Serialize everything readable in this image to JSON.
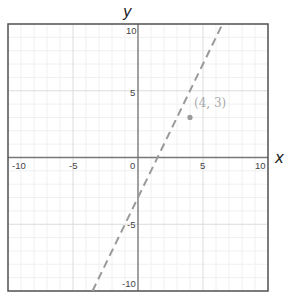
{
  "chart_data": {
    "type": "line",
    "title": "",
    "xlabel": "x",
    "ylabel": "y",
    "xlim": [
      -10,
      10
    ],
    "ylim": [
      -10,
      10
    ],
    "grid": true,
    "minor_grid_step": 1,
    "major_grid_step": 5,
    "x_ticks": [
      -10,
      -5,
      0,
      5,
      10
    ],
    "y_ticks": [
      -10,
      -5,
      5,
      10
    ],
    "x_tick_labels": [
      "-10",
      "-5",
      "0",
      "5",
      "10"
    ],
    "y_tick_labels": [
      "-10",
      "-5",
      "5",
      "10"
    ],
    "series": [
      {
        "name": "line",
        "style": "dashed",
        "color": "#9a9a9a",
        "equation": "y = 2x - 3",
        "slope": 2,
        "intercept": -3,
        "x": [
          -3.5,
          6.5
        ],
        "y": [
          -10,
          10
        ]
      },
      {
        "name": "point",
        "style": "marker",
        "color": "#9a9a9a",
        "x": [
          4
        ],
        "y": [
          3
        ],
        "label": "(4, 3)"
      }
    ],
    "legend": null
  },
  "labels": {
    "x_axis": "x",
    "y_axis": "y",
    "point": "(4, 3)",
    "x_ticks": [
      "-10",
      "-5",
      "0",
      "5",
      "10"
    ],
    "y_ticks": [
      "10",
      "5",
      "-5",
      "-10"
    ]
  },
  "colors": {
    "border": "#555555",
    "axis": "#777777",
    "major_grid": "#dcdcdc",
    "minor_grid": "#f0f0f0",
    "line": "#9a9a9a",
    "point": "#9a9a9a",
    "point_label": "#aaaaaa"
  }
}
